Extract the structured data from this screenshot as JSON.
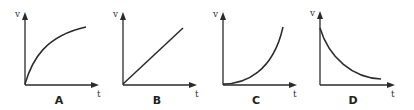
{
  "figure": {
    "stroke_color": "#2a2a2a",
    "panels": [
      {
        "id": "A",
        "label": "A",
        "y_axis": "v",
        "x_axis": "t",
        "curve": "increasing, concave down (approaching constant velocity)"
      },
      {
        "id": "B",
        "label": "B",
        "y_axis": "v",
        "x_axis": "t",
        "curve": "linear increase from origin (constant acceleration)"
      },
      {
        "id": "C",
        "label": "C",
        "y_axis": "v",
        "x_axis": "t",
        "curve": "increasing, concave up (increasing acceleration)"
      },
      {
        "id": "D",
        "label": "D",
        "y_axis": "v",
        "x_axis": "t",
        "curve": "decreasing, concave up (decaying velocity)"
      }
    ]
  }
}
